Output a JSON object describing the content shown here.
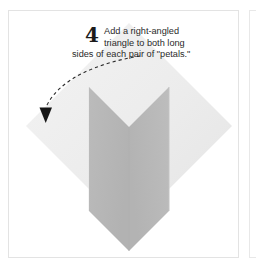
{
  "page": {
    "background_color": "#ffffff",
    "panel_border_color": "#e3e3e3"
  },
  "instruction": {
    "step_number": "4",
    "lines": [
      "Add a right-angled",
      "triangle to both long",
      "sides of each pair of \"petals.\""
    ],
    "full_text": "Add a right-angled triangle to both long sides of each pair of \"petals.\"",
    "text_color": "#2a2a2a"
  },
  "diagram": {
    "name": "origami-folded-square-diagram",
    "shapes": [
      {
        "name": "paper-diamond-back",
        "fill": "#efefef",
        "points": "25,125 128,22 231,125 128,228"
      },
      {
        "name": "left-petal-dark",
        "fill": "#b5b5b5",
        "points": "88,86 128,126 128,250 88,210"
      },
      {
        "name": "right-petal-dark",
        "fill": "#b5b5b5",
        "points": "168,86 168,210 128,250 128,126"
      }
    ],
    "colors": {
      "paper_light": "#efefef",
      "paper_mid": "#e6e6e6",
      "petal_dark": "#b5b5b5",
      "petal_shadow": "#ababab"
    }
  },
  "arrow": {
    "name": "curved-dashed-arrow",
    "style": "dashed",
    "color": "#2b2b2b",
    "direction": "down-left",
    "start": "136,57",
    "end": "44,112",
    "head": "filled-triangle-pointing-down"
  }
}
